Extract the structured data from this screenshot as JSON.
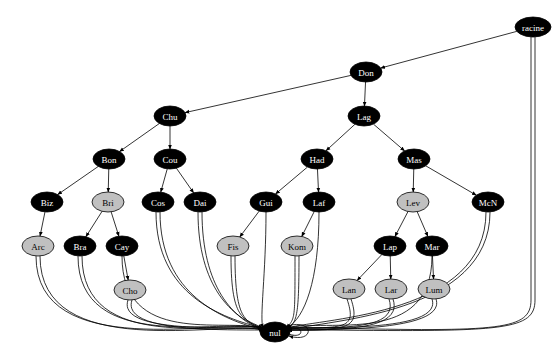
{
  "diagram": {
    "type": "directed-graph",
    "colors": {
      "dark_node": "#000000",
      "light_node": "#c0c0c0",
      "dark_text": "#ffffff",
      "light_text": "#000000",
      "edge": "#000000"
    },
    "nodes": [
      {
        "id": "racine",
        "label": "racine",
        "x": 533,
        "y": 27,
        "rx": 18,
        "ry": 10,
        "style": "dark"
      },
      {
        "id": "Don",
        "label": "Don",
        "x": 366,
        "y": 72,
        "rx": 16,
        "ry": 10,
        "style": "dark"
      },
      {
        "id": "Chu",
        "label": "Chu",
        "x": 170,
        "y": 116,
        "rx": 16,
        "ry": 10,
        "style": "dark"
      },
      {
        "id": "Lag",
        "label": "Lag",
        "x": 364,
        "y": 116,
        "rx": 16,
        "ry": 10,
        "style": "dark"
      },
      {
        "id": "Bon",
        "label": "Bon",
        "x": 109,
        "y": 159,
        "rx": 16,
        "ry": 10,
        "style": "dark"
      },
      {
        "id": "Cou",
        "label": "Cou",
        "x": 170,
        "y": 159,
        "rx": 16,
        "ry": 10,
        "style": "dark"
      },
      {
        "id": "Had",
        "label": "Had",
        "x": 317,
        "y": 159,
        "rx": 16,
        "ry": 10,
        "style": "dark"
      },
      {
        "id": "Mas",
        "label": "Mas",
        "x": 414,
        "y": 159,
        "rx": 16,
        "ry": 10,
        "style": "dark"
      },
      {
        "id": "Biz",
        "label": "Biz",
        "x": 47,
        "y": 202,
        "rx": 16,
        "ry": 10,
        "style": "dark"
      },
      {
        "id": "Bri",
        "label": "Bri",
        "x": 108,
        "y": 202,
        "rx": 16,
        "ry": 10,
        "style": "light"
      },
      {
        "id": "Cos",
        "label": "Cos",
        "x": 158,
        "y": 202,
        "rx": 16,
        "ry": 10,
        "style": "dark"
      },
      {
        "id": "Dai",
        "label": "Dai",
        "x": 200,
        "y": 202,
        "rx": 16,
        "ry": 10,
        "style": "dark"
      },
      {
        "id": "Gui",
        "label": "Gui",
        "x": 266,
        "y": 202,
        "rx": 16,
        "ry": 10,
        "style": "dark"
      },
      {
        "id": "Laf",
        "label": "Laf",
        "x": 319,
        "y": 202,
        "rx": 16,
        "ry": 10,
        "style": "dark"
      },
      {
        "id": "Lev",
        "label": "Lev",
        "x": 413,
        "y": 202,
        "rx": 16,
        "ry": 10,
        "style": "light"
      },
      {
        "id": "McN",
        "label": "McN",
        "x": 488,
        "y": 202,
        "rx": 16,
        "ry": 10,
        "style": "dark"
      },
      {
        "id": "Arc",
        "label": "Arc",
        "x": 38,
        "y": 246,
        "rx": 16,
        "ry": 10,
        "style": "light"
      },
      {
        "id": "Bra",
        "label": "Bra",
        "x": 80,
        "y": 246,
        "rx": 16,
        "ry": 10,
        "style": "dark"
      },
      {
        "id": "Cay",
        "label": "Cay",
        "x": 122,
        "y": 246,
        "rx": 16,
        "ry": 10,
        "style": "dark"
      },
      {
        "id": "Fis",
        "label": "Fis",
        "x": 233,
        "y": 246,
        "rx": 16,
        "ry": 10,
        "style": "light"
      },
      {
        "id": "Kom",
        "label": "Kom",
        "x": 297,
        "y": 246,
        "rx": 16,
        "ry": 10,
        "style": "light"
      },
      {
        "id": "Lap",
        "label": "Lap",
        "x": 390,
        "y": 246,
        "rx": 16,
        "ry": 10,
        "style": "dark"
      },
      {
        "id": "Mar",
        "label": "Mar",
        "x": 432,
        "y": 246,
        "rx": 16,
        "ry": 10,
        "style": "dark"
      },
      {
        "id": "Cho",
        "label": "Cho",
        "x": 130,
        "y": 290,
        "rx": 16,
        "ry": 10,
        "style": "light"
      },
      {
        "id": "Lan",
        "label": "Lan",
        "x": 349,
        "y": 289,
        "rx": 16,
        "ry": 10,
        "style": "light"
      },
      {
        "id": "Lar",
        "label": "Lar",
        "x": 391,
        "y": 289,
        "rx": 16,
        "ry": 10,
        "style": "light"
      },
      {
        "id": "Lum",
        "label": "Lum",
        "x": 434,
        "y": 289,
        "rx": 16,
        "ry": 10,
        "style": "light"
      },
      {
        "id": "nul",
        "label": "nul",
        "x": 275,
        "y": 332,
        "rx": 15,
        "ry": 10,
        "style": "dark"
      }
    ],
    "tree_edges": [
      [
        "racine",
        "Don"
      ],
      [
        "Don",
        "Chu"
      ],
      [
        "Don",
        "Lag"
      ],
      [
        "Chu",
        "Bon"
      ],
      [
        "Chu",
        "Cou"
      ],
      [
        "Lag",
        "Had"
      ],
      [
        "Lag",
        "Mas"
      ],
      [
        "Bon",
        "Biz"
      ],
      [
        "Bon",
        "Bri"
      ],
      [
        "Cou",
        "Cos"
      ],
      [
        "Cou",
        "Dai"
      ],
      [
        "Had",
        "Gui"
      ],
      [
        "Had",
        "Laf"
      ],
      [
        "Mas",
        "Lev"
      ],
      [
        "Mas",
        "McN"
      ],
      [
        "Biz",
        "Arc"
      ],
      [
        "Bri",
        "Bra"
      ],
      [
        "Bri",
        "Cay"
      ],
      [
        "Gui",
        "Fis"
      ],
      [
        "Laf",
        "Kom"
      ],
      [
        "Lev",
        "Lap"
      ],
      [
        "Lev",
        "Mar"
      ],
      [
        "Cay",
        "Cho"
      ],
      [
        "Lap",
        "Lan"
      ],
      [
        "Lap",
        "Lar"
      ],
      [
        "Mar",
        "Lum"
      ]
    ],
    "null_edges": [
      [
        "racine",
        2
      ],
      [
        "Arc",
        2
      ],
      [
        "Bra",
        2
      ],
      [
        "Cay",
        1
      ],
      [
        "Cho",
        2
      ],
      [
        "Cos",
        2
      ],
      [
        "Dai",
        2
      ],
      [
        "Gui",
        1
      ],
      [
        "Fis",
        2
      ],
      [
        "Laf",
        1
      ],
      [
        "Kom",
        2
      ],
      [
        "Lan",
        2
      ],
      [
        "Lar",
        2
      ],
      [
        "Lum",
        2
      ],
      [
        "Lap",
        0
      ],
      [
        "Mar",
        1
      ],
      [
        "McN",
        2
      ],
      [
        "Biz",
        0
      ],
      [
        "Bri",
        0
      ]
    ],
    "self_loop": "nul"
  }
}
